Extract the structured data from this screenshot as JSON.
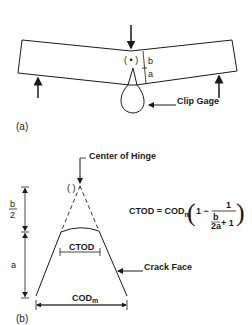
{
  "panel_a": {
    "label": "(a)",
    "dim_b": "b",
    "dim_a": "a",
    "hinge_symbol": "( • )",
    "clip_gage_label": "Clip Gage"
  },
  "panel_b": {
    "label": "(b)",
    "center_of_hinge_label": "Center of Hinge",
    "hinge_symbol": "( )",
    "dim_b_num": "b",
    "dim_b_den": "2",
    "dim_a": "a",
    "ctod_label": "CTOD",
    "codm_label": "COD",
    "codm_sub": "m",
    "crack_face_label": "Crack Face",
    "formula": {
      "lhs": "CTOD = COD",
      "lhs_sub": "m",
      "one_minus": "1 −",
      "numerator": "1",
      "inner_num": "b",
      "inner_den": "2a",
      "plus_one": "+ 1"
    }
  },
  "colors": {
    "ink": "#1a1a1a",
    "background": "#ffffff"
  }
}
